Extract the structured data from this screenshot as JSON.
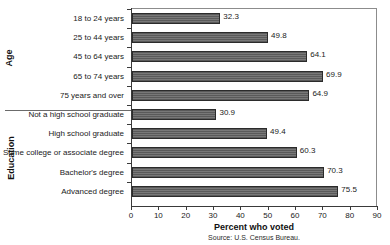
{
  "chart_data": {
    "type": "bar",
    "orientation": "horizontal",
    "title": "",
    "xlabel": "Percent who voted",
    "ylabel": "",
    "xlim": [
      0,
      90
    ],
    "xticks": [
      0,
      10,
      20,
      30,
      40,
      50,
      60,
      70,
      80,
      90
    ],
    "grid": false,
    "legend": null,
    "source": "Source: U.S. Census Bureau.",
    "groups": [
      {
        "name": "Age",
        "categories": [
          "18 to 24 years",
          "25 to 44 years",
          "45 to 64 years",
          "65 to 74 years",
          "75 years and over"
        ],
        "values": [
          32.3,
          49.8,
          64.1,
          69.9,
          64.9
        ]
      },
      {
        "name": "Education",
        "categories": [
          "Not a high school graduate",
          "High school graduate",
          "Some college or associate degree",
          "Bachelor's degree",
          "Advanced degree"
        ],
        "values": [
          30.9,
          49.4,
          60.3,
          70.3,
          75.5
        ]
      }
    ],
    "categories": [
      "18 to 24 years",
      "25 to 44 years",
      "45 to 64 years",
      "65 to 74 years",
      "75 years and over",
      "Not a high school graduate",
      "High school graduate",
      "Some college or associate degree",
      "Bachelor's degree",
      "Advanced degree"
    ],
    "values": [
      32.3,
      49.8,
      64.1,
      69.9,
      64.9,
      30.9,
      49.4,
      60.3,
      70.3,
      75.5
    ],
    "value_labels": [
      "32.3",
      "49.8",
      "64.1",
      "69.9",
      "64.9",
      "30.9",
      "49.4",
      "60.3",
      "70.3",
      "75.5"
    ],
    "xtick_labels": [
      "0",
      "10",
      "20",
      "30",
      "40",
      "50",
      "60",
      "70",
      "80",
      "90"
    ],
    "colors": {
      "bar_fill": "#6e6e6e",
      "bar_stripe": "#5a5a5a",
      "bar_border": "#2b2b2b",
      "axis": "#3a3a3a",
      "frame": "#8c8c8c",
      "text": "#1a1a1a",
      "background": "#ffffff"
    }
  }
}
